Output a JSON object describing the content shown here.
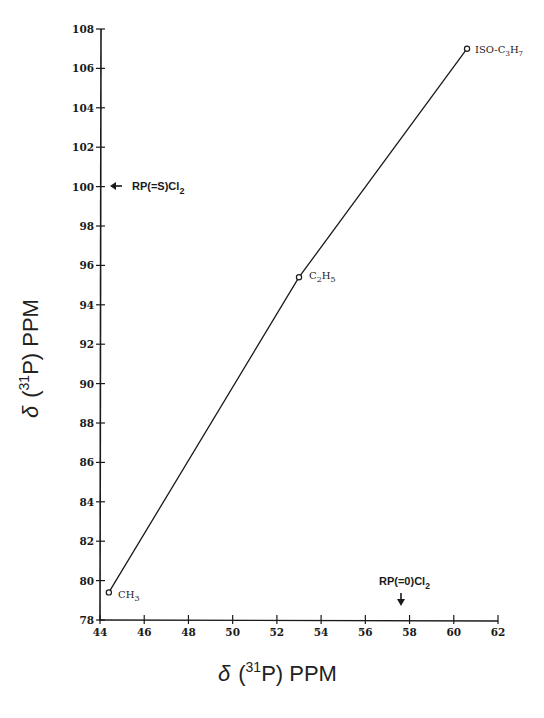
{
  "chart_data": {
    "type": "line",
    "title": "",
    "xlabel": "δ (31P) PPM",
    "ylabel": "δ (31P) PPM",
    "xlim": [
      44,
      62
    ],
    "ylim": [
      78,
      108
    ],
    "x_ticks": [
      44,
      46,
      48,
      50,
      52,
      54,
      56,
      58,
      60,
      62
    ],
    "y_ticks": [
      78,
      80,
      82,
      84,
      86,
      88,
      90,
      92,
      94,
      96,
      98,
      100,
      102,
      104,
      106,
      108
    ],
    "grid": false,
    "legend": null,
    "series": [
      {
        "name": "R group",
        "marker": "open-circle",
        "points": [
          {
            "label": "CH3",
            "x": 44.4,
            "y": 79.4
          },
          {
            "label": "C2H5",
            "x": 53.0,
            "y": 95.4
          },
          {
            "label": "ISO-C3H7",
            "x": 60.6,
            "y": 107.0
          }
        ]
      }
    ],
    "annotations": [
      {
        "text": "RP(=S)Cl2",
        "axis": "y",
        "value": 99.8,
        "arrow": "left"
      },
      {
        "text": "RP(=O)Cl2",
        "axis": "x",
        "value": 57.6,
        "arrow": "down"
      }
    ]
  },
  "labels": {
    "xlabel_delta": "δ",
    "xlabel_open": "(",
    "xlabel_sup": "31",
    "xlabel_rest": "P)  PPM",
    "ylabel_delta": "δ",
    "ylabel_open": "(",
    "ylabel_sup": "31",
    "ylabel_rest": "P)  PPM",
    "point_ch3_main": "CH",
    "point_ch3_sub": "3",
    "point_c2h5_c": "C",
    "point_c2h5_sub1": "2",
    "point_c2h5_h": "H",
    "point_c2h5_sub2": "5",
    "point_iso_c": "ISO-C",
    "point_iso_sub1": "3",
    "point_iso_h": "H",
    "point_iso_sub2": "7",
    "annot_s_main": "RP(=S)Cl",
    "annot_s_sub": "2",
    "annot_o_main": "RP(=0)Cl",
    "annot_o_sub": "2"
  }
}
